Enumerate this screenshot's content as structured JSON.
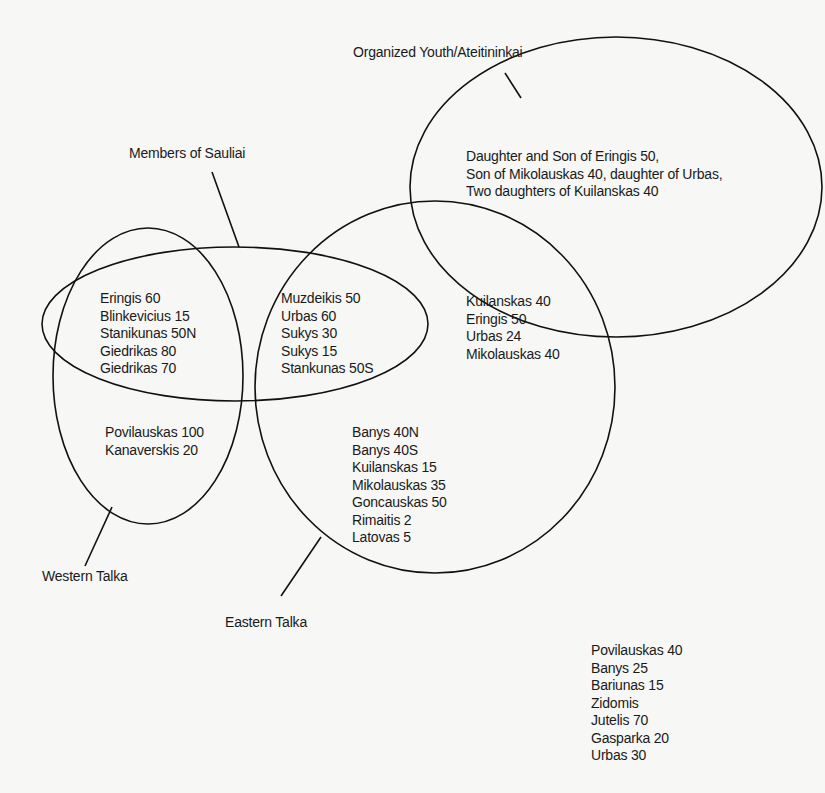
{
  "diagram": {
    "type": "venn",
    "sets": {
      "organized_youth": {
        "label": "Organized Youth/Ateitininkai",
        "members_only": [
          "Daughter and Son of Eringis 50,",
          "Son of Mikolauskas 40, daughter of Urbas,",
          "Two daughters of Kuilanskas 40"
        ]
      },
      "sauliai": {
        "label": "Members of Sauliai"
      },
      "western_talka": {
        "label": "Western Talka"
      },
      "eastern_talka": {
        "label": "Eastern Talka"
      }
    },
    "regions": {
      "western_and_sauliai": [
        "Eringis 60",
        "Blinkevicius 15",
        "Stanikunas 50N",
        "Giedrikas 80",
        "Giedrikas 70"
      ],
      "eastern_and_sauliai": [
        "Muzdeikis 50",
        "Urbas 60",
        "Sukys 30",
        "Sukys 15",
        "Stankunas 50S"
      ],
      "eastern_and_youth": [
        "Kuilanskas 40",
        "Eringis 50",
        "Urbas 24",
        "Mikolauskas 40"
      ],
      "western_only": [
        "Povilauskas 100",
        "Kanaverskis 20"
      ],
      "eastern_only": [
        "Banys 40N",
        "Banys 40S",
        "Kuilanskas 15",
        "Mikolauskas 35",
        "Goncauskas 50",
        "Rimaitis 2",
        "Latovas 5"
      ],
      "outside_all": [
        "Povilauskas 40",
        "Banys 25",
        "Bariunas 15",
        "Zidomis",
        "Jutelis 70",
        "Gasparka 20",
        "Urbas 30"
      ]
    }
  }
}
